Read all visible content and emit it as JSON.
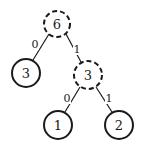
{
  "diagram": {
    "type": "huffman-tree",
    "nodes": [
      {
        "id": "root",
        "label": "6",
        "x": 57,
        "y": 24,
        "r": 13,
        "style": "dashed"
      },
      {
        "id": "left-leaf",
        "label": "3",
        "x": 26,
        "y": 73,
        "r": 14,
        "style": "solid"
      },
      {
        "id": "internal",
        "label": "3",
        "x": 88,
        "y": 75,
        "r": 14,
        "style": "dashed"
      },
      {
        "id": "leaf-1",
        "label": "1",
        "x": 58,
        "y": 125,
        "r": 14,
        "style": "solid"
      },
      {
        "id": "leaf-2",
        "label": "2",
        "x": 119,
        "y": 125,
        "r": 14,
        "style": "solid"
      }
    ],
    "edges": [
      {
        "from": "root",
        "to": "left-leaf",
        "label": "0",
        "lx": 35,
        "ly": 44
      },
      {
        "from": "root",
        "to": "internal",
        "label": "1",
        "lx": 77,
        "ly": 49
      },
      {
        "from": "internal",
        "to": "leaf-1",
        "label": "0",
        "lx": 67,
        "ly": 98
      },
      {
        "from": "internal",
        "to": "leaf-2",
        "label": "1",
        "lx": 109,
        "ly": 98
      }
    ]
  }
}
